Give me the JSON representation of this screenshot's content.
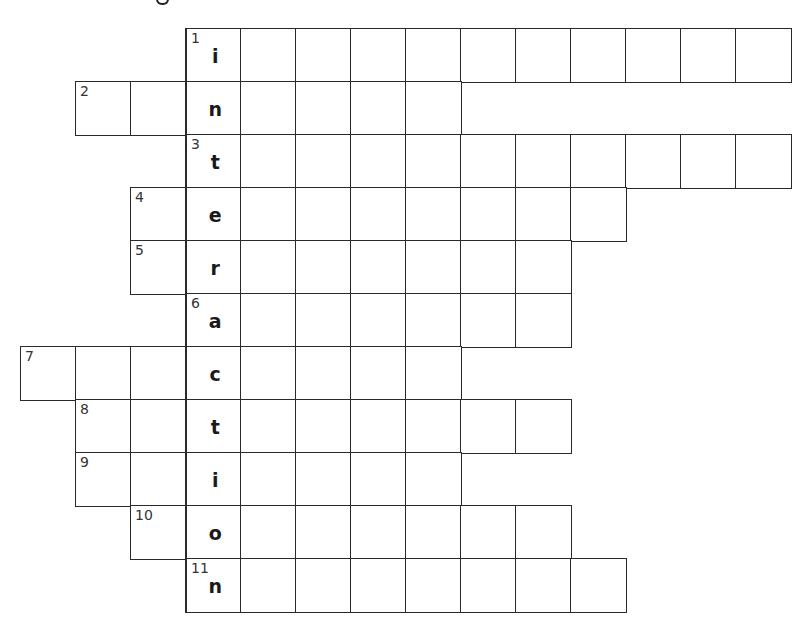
{
  "puzzle": {
    "type": "crossword",
    "key_word": "interaction",
    "key_column_index": 3,
    "cell_size": 55,
    "origin": {
      "x": 20,
      "y": 28
    },
    "row_height": 53,
    "rows": [
      {
        "clue_number": "1",
        "start_col": 3,
        "length": 11,
        "key_letter": "i",
        "number_in_key_cell": true
      },
      {
        "clue_number": "2",
        "start_col": 1,
        "length": 7,
        "key_letter": "n",
        "number_in_key_cell": false
      },
      {
        "clue_number": "3",
        "start_col": 3,
        "length": 11,
        "key_letter": "t",
        "number_in_key_cell": true
      },
      {
        "clue_number": "4",
        "start_col": 2,
        "length": 9,
        "key_letter": "e",
        "number_in_key_cell": false
      },
      {
        "clue_number": "5",
        "start_col": 2,
        "length": 8,
        "key_letter": "r",
        "number_in_key_cell": false
      },
      {
        "clue_number": "6",
        "start_col": 3,
        "length": 7,
        "key_letter": "a",
        "number_in_key_cell": true
      },
      {
        "clue_number": "7",
        "start_col": 0,
        "length": 8,
        "key_letter": "c",
        "number_in_key_cell": false
      },
      {
        "clue_number": "8",
        "start_col": 1,
        "length": 9,
        "key_letter": "t",
        "number_in_key_cell": false
      },
      {
        "clue_number": "9",
        "start_col": 1,
        "length": 7,
        "key_letter": "i",
        "number_in_key_cell": false
      },
      {
        "clue_number": "10",
        "start_col": 2,
        "length": 8,
        "key_letter": "o",
        "number_in_key_cell": false
      },
      {
        "clue_number": "11",
        "start_col": 3,
        "length": 8,
        "key_letter": "n",
        "number_in_key_cell": true
      }
    ]
  },
  "colors": {
    "grid_line": "#2a2a2a",
    "background": "#ffffff",
    "letter": "#1a1a1a",
    "clue_number": "#333333"
  }
}
